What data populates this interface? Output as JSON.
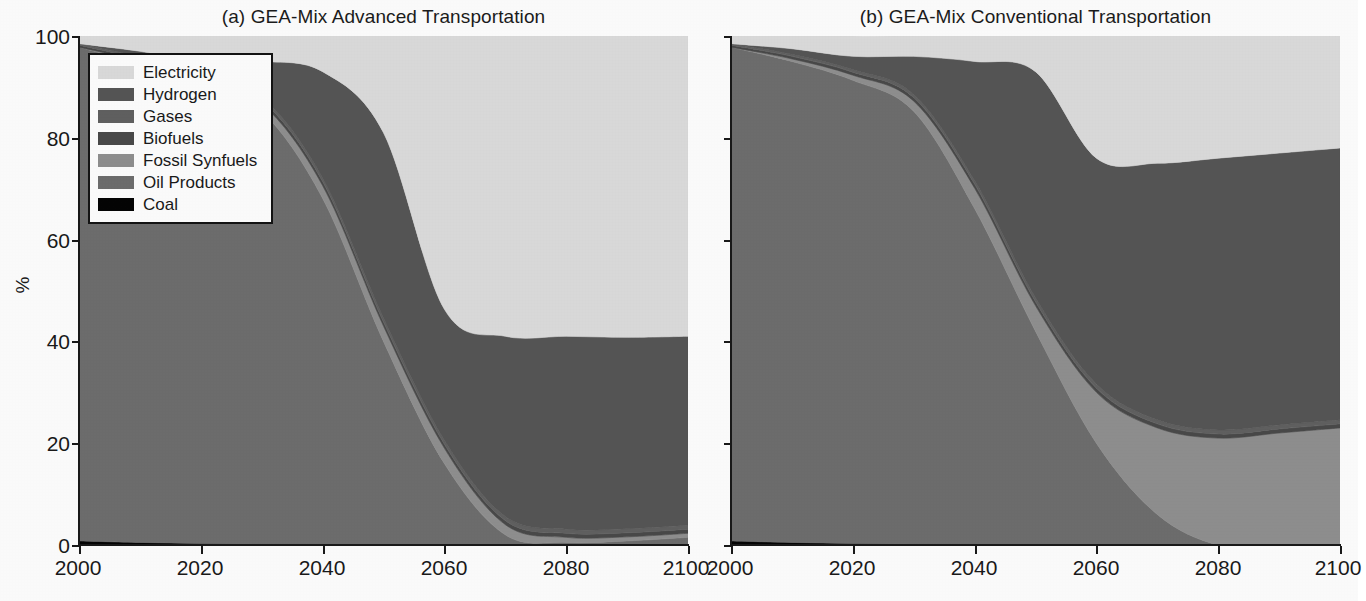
{
  "figure": {
    "panels": [
      {
        "id": "a",
        "title": "(a) GEA-Mix Advanced Transportation"
      },
      {
        "id": "b",
        "title": "(b) GEA-Mix Conventional Transportation"
      }
    ],
    "ylabel": "%",
    "ytick_labels": [
      "100",
      "80",
      "60",
      "40",
      "20",
      "0"
    ],
    "xtick_labels": [
      "2000",
      "2020",
      "2040",
      "2060",
      "2080",
      "2100"
    ]
  },
  "legend": {
    "items": [
      {
        "label": "Electricity",
        "color": "#dcdcdc"
      },
      {
        "label": "Hydrogen",
        "color": "#565656"
      },
      {
        "label": "Gases",
        "color": "#616161"
      },
      {
        "label": "Biofuels",
        "color": "#4a4a4a"
      },
      {
        "label": "Fossil Synfuels",
        "color": "#909090"
      },
      {
        "label": "Oil Products",
        "color": "#6e6e6e"
      },
      {
        "label": "Coal",
        "color": "#050505"
      }
    ]
  },
  "chart_data": [
    {
      "type": "area",
      "id": "a",
      "title": "(a) GEA-Mix Advanced Transportation",
      "stacked": true,
      "normalized_percent": true,
      "xlabel": "",
      "ylabel": "%",
      "xlim": [
        2000,
        2100
      ],
      "ylim": [
        0,
        100
      ],
      "grid": false,
      "legend_position": "upper-left-inside",
      "x": [
        2000,
        2010,
        2020,
        2030,
        2040,
        2050,
        2060,
        2070,
        2080,
        2090,
        2100
      ],
      "series": [
        {
          "name": "Coal",
          "color": "#050505",
          "values": [
            0.8,
            0.5,
            0.3,
            0.2,
            0.1,
            0.0,
            0.0,
            0.0,
            0.0,
            0.0,
            0.0
          ]
        },
        {
          "name": "Oil Products",
          "color": "#6e6e6e",
          "values": [
            97.0,
            94.0,
            90.0,
            85.0,
            68.0,
            40.0,
            16.0,
            2.0,
            0.5,
            0.8,
            1.5
          ]
        },
        {
          "name": "Fossil Synfuels",
          "color": "#909090",
          "values": [
            0.0,
            0.5,
            1.0,
            1.5,
            2.5,
            3.0,
            3.0,
            2.0,
            1.0,
            0.8,
            0.8
          ]
        },
        {
          "name": "Biofuels",
          "color": "#4a4a4a",
          "values": [
            0.4,
            0.5,
            0.6,
            0.7,
            0.8,
            0.8,
            0.8,
            0.8,
            0.8,
            0.8,
            0.8
          ]
        },
        {
          "name": "Gases",
          "color": "#616161",
          "values": [
            0.3,
            0.4,
            0.5,
            0.6,
            0.7,
            0.8,
            0.8,
            0.8,
            0.8,
            0.8,
            0.8
          ]
        },
        {
          "name": "Hydrogen",
          "color": "#565656",
          "values": [
            0.0,
            1.1,
            2.6,
            7.0,
            20.9,
            36.4,
            25.7,
            35.4,
            37.9,
            37.6,
            37.1
          ]
        },
        {
          "name": "Electricity",
          "color": "#dcdcdc",
          "values": [
            1.5,
            3.0,
            5.0,
            5.0,
            7.0,
            19.0,
            53.7,
            59.0,
            59.0,
            59.2,
            59.0
          ]
        }
      ],
      "boundaries_percent": {
        "note": "cumulative top-of-stack values read off the figure",
        "oil_products_top": [
          98.0,
          95.0,
          91.0,
          86.0,
          69.0,
          40.5,
          16.0,
          2.0,
          0.5,
          0.8,
          1.5
        ],
        "fossil_synfuels_top": [
          98.0,
          95.5,
          92.0,
          87.5,
          71.5,
          43.5,
          19.0,
          4.0,
          1.5,
          1.6,
          2.3
        ],
        "hydrogen_top": [
          98.5,
          97.0,
          95.0,
          94.7,
          93.0,
          81.0,
          46.3,
          41.0,
          41.0,
          41.0,
          41.0
        ],
        "electricity_top": [
          100,
          100,
          100,
          100,
          100,
          100,
          100,
          100,
          100,
          100,
          100
        ]
      }
    },
    {
      "type": "area",
      "id": "b",
      "title": "(b) GEA-Mix Conventional Transportation",
      "stacked": true,
      "normalized_percent": true,
      "xlabel": "",
      "ylabel": "%",
      "xlim": [
        2000,
        2100
      ],
      "ylim": [
        0,
        100
      ],
      "grid": false,
      "legend_position": "none",
      "x": [
        2000,
        2010,
        2020,
        2030,
        2040,
        2050,
        2060,
        2070,
        2080,
        2090,
        2100
      ],
      "series": [
        {
          "name": "Coal",
          "color": "#050505",
          "values": [
            0.8,
            0.5,
            0.3,
            0.2,
            0.1,
            0.0,
            0.0,
            0.0,
            0.0,
            0.0,
            0.0
          ]
        },
        {
          "name": "Oil Products",
          "color": "#6e6e6e",
          "values": [
            97.0,
            94.5,
            91.0,
            85.0,
            66.0,
            42.0,
            20.0,
            6.0,
            0.0,
            0.0,
            0.0
          ]
        },
        {
          "name": "Fossil Synfuels",
          "color": "#909090",
          "values": [
            0.0,
            0.5,
            1.0,
            2.0,
            4.0,
            5.0,
            10.0,
            17.0,
            21.0,
            22.0,
            23.0
          ]
        },
        {
          "name": "Biofuels",
          "color": "#4a4a4a",
          "values": [
            0.4,
            0.5,
            0.6,
            0.7,
            0.8,
            0.8,
            0.8,
            0.8,
            0.8,
            0.8,
            0.8
          ]
        },
        {
          "name": "Gases",
          "color": "#616161",
          "values": [
            0.3,
            0.4,
            0.5,
            0.6,
            0.7,
            0.8,
            0.8,
            0.8,
            0.8,
            0.8,
            0.8
          ]
        },
        {
          "name": "Hydrogen",
          "color": "#565656",
          "values": [
            0.0,
            1.1,
            2.6,
            7.5,
            23.4,
            44.4,
            44.4,
            50.4,
            53.4,
            53.4,
            53.4
          ]
        },
        {
          "name": "Electricity",
          "color": "#dcdcdc",
          "values": [
            1.5,
            3.0,
            4.0,
            4.0,
            5.0,
            7.0,
            24.0,
            25.0,
            24.0,
            23.0,
            22.0
          ]
        }
      ],
      "boundaries_percent": {
        "note": "cumulative top-of-stack values read off the figure",
        "oil_products_top": [
          98.0,
          95.5,
          92.0,
          86.0,
          66.5,
          42.0,
          20.0,
          6.0,
          0.0,
          0.0,
          0.0
        ],
        "fossil_synfuels_top": [
          98.0,
          96.0,
          93.0,
          88.0,
          70.5,
          47.0,
          30.0,
          23.0,
          21.0,
          22.0,
          23.0
        ],
        "hydrogen_top": [
          98.5,
          97.5,
          96.5,
          95.0,
          91.0,
          84.0,
          76.0,
          76.0,
          76.5,
          77.0,
          77.0
        ],
        "electricity_top": [
          100,
          100,
          100,
          100,
          100,
          100,
          100,
          100,
          100,
          100,
          100
        ]
      }
    }
  ]
}
